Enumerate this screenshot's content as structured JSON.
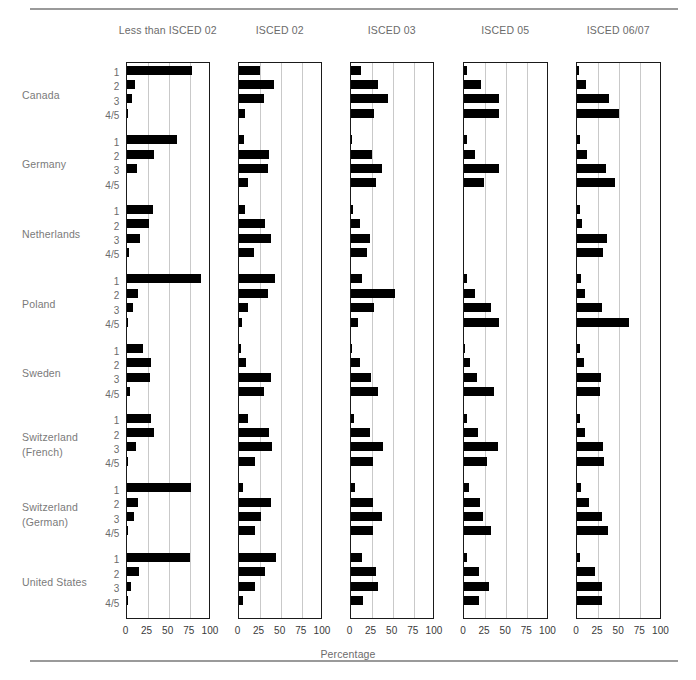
{
  "figure": {
    "x_axis_title": "Percentage",
    "row_tick_labels": [
      "1",
      "2",
      "3",
      "4/5"
    ],
    "x_tick_labels": [
      "0",
      "25",
      "50",
      "75",
      "100"
    ],
    "bar_color": "#000000",
    "grid_color": "#c9c9c9",
    "axis_color": "#1a1a1a",
    "label_color": "#6b6b6b"
  },
  "chart_data": {
    "type": "bar",
    "title": "",
    "subtitle": "",
    "xlabel": "Percentage",
    "ylabel": "",
    "xlim": [
      0,
      100
    ],
    "xticks": [
      0,
      25,
      50,
      75,
      100
    ],
    "grid": true,
    "legend": "none",
    "orientation": "horizontal",
    "panel_labels": [
      "Less than ISCED 02",
      "ISCED 02",
      "ISCED 03",
      "ISCED 05",
      "ISCED 06/07"
    ],
    "group_labels": [
      "Canada",
      "Germany",
      "Netherlands",
      "Poland",
      "Sweden",
      "Switzerland (French)",
      "Switzerland (German)",
      "United States"
    ],
    "categories": [
      "1",
      "2",
      "3",
      "4/5"
    ],
    "panels": [
      {
        "name": "Less than ISCED 02",
        "groups": [
          {
            "name": "Canada",
            "values": [
              77,
              10,
              7,
              1
            ]
          },
          {
            "name": "Germany",
            "values": [
              60,
              32,
              13,
              0
            ]
          },
          {
            "name": "Netherlands",
            "values": [
              31,
              27,
              16,
              3
            ]
          },
          {
            "name": "Poland",
            "values": [
              88,
              14,
              8,
              1
            ]
          },
          {
            "name": "Sweden",
            "values": [
              20,
              29,
              28,
              4
            ]
          },
          {
            "name": "Switzerland (French)",
            "values": [
              29,
              33,
              11,
              1
            ]
          },
          {
            "name": "Switzerland (German)",
            "values": [
              76,
              14,
              9,
              1
            ]
          },
          {
            "name": "United States",
            "values": [
              75,
              15,
              5,
              1
            ]
          }
        ]
      },
      {
        "name": "ISCED 02",
        "groups": [
          {
            "name": "Canada",
            "values": [
              25,
              42,
              30,
              8
            ]
          },
          {
            "name": "Germany",
            "values": [
              7,
              36,
              35,
              11
            ]
          },
          {
            "name": "Netherlands",
            "values": [
              8,
              31,
              38,
              18
            ]
          },
          {
            "name": "Poland",
            "values": [
              43,
              35,
              11,
              4
            ]
          },
          {
            "name": "Sweden",
            "values": [
              3,
              9,
              38,
              30
            ]
          },
          {
            "name": "Switzerland (French)",
            "values": [
              11,
              36,
              40,
              19
            ]
          },
          {
            "name": "Switzerland (German)",
            "values": [
              5,
              39,
              27,
              19
            ]
          },
          {
            "name": "United States",
            "values": [
              44,
              31,
              19,
              5
            ]
          }
        ]
      },
      {
        "name": "ISCED 03",
        "groups": [
          {
            "name": "Canada",
            "values": [
              13,
              32,
              44,
              28
            ]
          },
          {
            "name": "Germany",
            "values": [
              2,
              25,
              37,
              30
            ]
          },
          {
            "name": "Netherlands",
            "values": [
              3,
              11,
              23,
              20
            ]
          },
          {
            "name": "Poland",
            "values": [
              14,
              53,
              28,
              9
            ]
          },
          {
            "name": "Sweden",
            "values": [
              2,
              11,
              24,
              33
            ]
          },
          {
            "name": "Switzerland (French)",
            "values": [
              4,
              23,
              38,
              27
            ]
          },
          {
            "name": "Switzerland (German)",
            "values": [
              5,
              27,
              37,
              27
            ]
          },
          {
            "name": "United States",
            "values": [
              14,
              30,
              32,
              15
            ]
          }
        ]
      },
      {
        "name": "ISCED 05",
        "groups": [
          {
            "name": "Canada",
            "values": [
              4,
              20,
              42,
              42
            ]
          },
          {
            "name": "Germany",
            "values": [
              3,
              13,
              41,
              24
            ]
          },
          {
            "name": "Netherlands",
            "values": [
              0,
              0,
              0,
              0
            ]
          },
          {
            "name": "Poland",
            "values": [
              4,
              13,
              32,
              42
            ]
          },
          {
            "name": "Sweden",
            "values": [
              1,
              7,
              15,
              36
            ]
          },
          {
            "name": "Switzerland (French)",
            "values": [
              4,
              16,
              40,
              27
            ]
          },
          {
            "name": "Switzerland (German)",
            "values": [
              6,
              19,
              23,
              32
            ]
          },
          {
            "name": "United States",
            "values": [
              4,
              18,
              29,
              18
            ]
          }
        ]
      },
      {
        "name": "ISCED 06/07",
        "groups": [
          {
            "name": "Canada",
            "values": [
              2,
              11,
              38,
              50
            ]
          },
          {
            "name": "Germany",
            "values": [
              3,
              12,
              34,
              45
            ]
          },
          {
            "name": "Netherlands",
            "values": [
              3,
              6,
              36,
              31
            ]
          },
          {
            "name": "Poland",
            "values": [
              5,
              10,
              30,
              61
            ]
          },
          {
            "name": "Sweden",
            "values": [
              3,
              8,
              28,
              27
            ]
          },
          {
            "name": "Switzerland (French)",
            "values": [
              4,
              9,
              31,
              32
            ]
          },
          {
            "name": "Switzerland (German)",
            "values": [
              5,
              14,
              30,
              37
            ]
          },
          {
            "name": "United States",
            "values": [
              3,
              21,
              30,
              30
            ]
          }
        ]
      }
    ]
  }
}
